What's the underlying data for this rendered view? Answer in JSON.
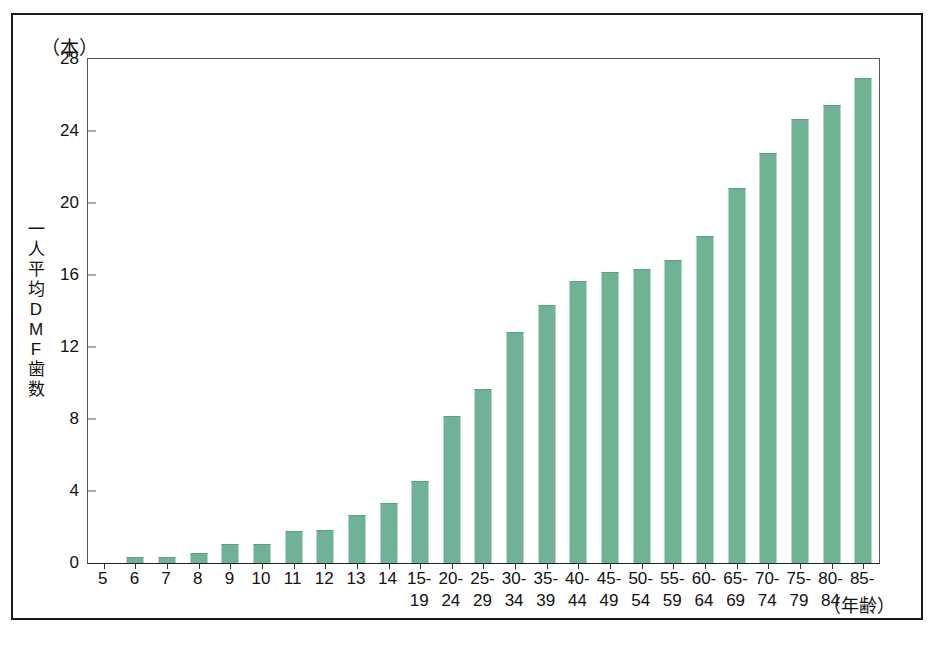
{
  "figure": {
    "unit_label": "（本）",
    "y_axis_title_chars": [
      "一",
      "人",
      "平",
      "均",
      "D",
      "M",
      "F",
      "歯",
      "数"
    ],
    "x_axis_title": "（年齢）",
    "frame_color": "#1a1a1a",
    "bar_color": "#6fb295"
  },
  "chart_data": {
    "type": "bar",
    "title": "",
    "subtitle": "",
    "xlabel": "（年齢）",
    "ylabel": "一人平均DMF歯数",
    "unit": "（本）",
    "ylim": [
      0,
      28
    ],
    "ytick_values": [
      0,
      4,
      8,
      12,
      16,
      20,
      24,
      28
    ],
    "ytick_labels": [
      "0",
      "4",
      "8",
      "12",
      "16",
      "20",
      "24",
      "28"
    ],
    "grid": false,
    "legend": null,
    "categories": [
      "5",
      "6",
      "7",
      "8",
      "9",
      "10",
      "11",
      "12",
      "13",
      "14",
      "15-19",
      "20-24",
      "25-29",
      "30-34",
      "35-39",
      "40-44",
      "45-49",
      "50-54",
      "55-59",
      "60-64",
      "65-69",
      "70-74",
      "75-79",
      "80-84",
      "85-"
    ],
    "category_lines": [
      [
        "5",
        ""
      ],
      [
        "6",
        ""
      ],
      [
        "7",
        ""
      ],
      [
        "8",
        ""
      ],
      [
        "9",
        ""
      ],
      [
        "10",
        ""
      ],
      [
        "11",
        ""
      ],
      [
        "12",
        ""
      ],
      [
        "13",
        ""
      ],
      [
        "14",
        ""
      ],
      [
        "15-",
        "19"
      ],
      [
        "20-",
        "24"
      ],
      [
        "25-",
        "29"
      ],
      [
        "30-",
        "34"
      ],
      [
        "35-",
        "39"
      ],
      [
        "40-",
        "44"
      ],
      [
        "45-",
        "49"
      ],
      [
        "50-",
        "54"
      ],
      [
        "55-",
        "59"
      ],
      [
        "60-",
        "64"
      ],
      [
        "65-",
        "69"
      ],
      [
        "70-",
        "74"
      ],
      [
        "75-",
        "79"
      ],
      [
        "80-",
        "84"
      ],
      [
        "85-",
        ""
      ]
    ],
    "values": [
      0,
      0.3,
      0.3,
      0.5,
      1.0,
      1.0,
      1.7,
      1.8,
      2.6,
      3.3,
      4.5,
      8.1,
      9.6,
      12.8,
      14.3,
      15.6,
      16.1,
      16.3,
      16.8,
      18.1,
      20.8,
      22.7,
      24.6,
      25.4,
      26.9
    ]
  }
}
